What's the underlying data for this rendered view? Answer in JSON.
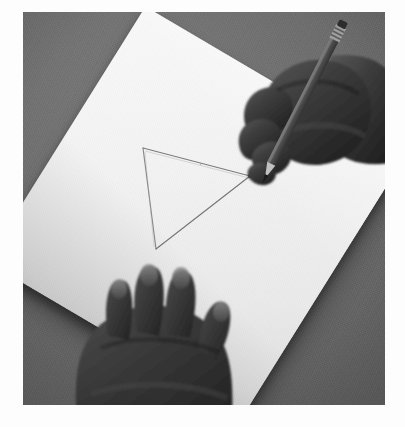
{
  "image": {
    "title": "Hand drawing a triangle on paper with a pencil",
    "medium": "black-and-white photograph",
    "orientation": "portrait",
    "border": "white photographic margin",
    "alt_text": "A right hand holds a pencil and draws a triangle on a sheet of white paper while a left hand steadies the paper on a gray table."
  },
  "scene": {
    "background_label": "gray table surface",
    "background_color": "#6f6f6f",
    "paper_label": "white sheet of paper",
    "paper_color": "#f1f1f1",
    "skin_label": "dark skin tone hand",
    "skin_color": "#3c3c3c",
    "pencil_label": "wooden pencil",
    "pencil_body_color": "#5a5248",
    "pencil_ferrule_color": "#9a9a9a",
    "pencil_eraser_color": "#2e2e2e",
    "graphite_color": "#6b6b6b"
  },
  "objects": [
    {
      "name": "gray-table-surface",
      "label": "Gray table surface"
    },
    {
      "name": "paper-sheet",
      "label": "Sheet of white paper"
    },
    {
      "name": "triangle-drawing",
      "label": "Pencil-drawn triangle"
    },
    {
      "name": "right-hand",
      "label": "Right hand holding pencil"
    },
    {
      "name": "left-hand",
      "label": "Left hand steadying paper"
    },
    {
      "name": "pencil",
      "label": "Pencil"
    }
  ],
  "drawing": {
    "shape": "triangle",
    "stroke_label": "light pencil line",
    "vertices": [
      {
        "name": "apex-top-left",
        "x": 143,
        "y": 148
      },
      {
        "name": "vertex-right",
        "x": 250,
        "y": 176
      },
      {
        "name": "vertex-bottom",
        "x": 156,
        "y": 249
      }
    ],
    "active_vertex": "vertex-right"
  },
  "paper_corners": [
    {
      "name": "corner-top",
      "x": 203,
      "y": 70
    },
    {
      "name": "corner-right",
      "x": 375,
      "y": 248
    },
    {
      "name": "corner-bottom",
      "x": 222,
      "y": 365
    },
    {
      "name": "corner-left",
      "x": 42,
      "y": 176
    }
  ],
  "caption": {
    "text": ""
  }
}
